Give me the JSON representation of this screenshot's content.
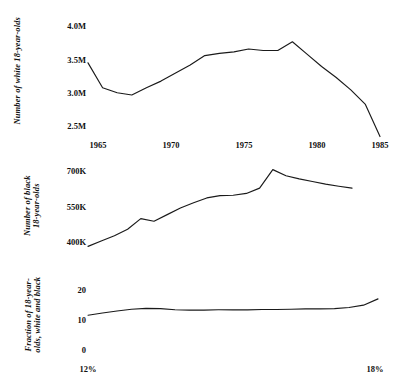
{
  "figure": {
    "background": "#ffffff",
    "line_color": "#1a1a1a",
    "panel_count": 3
  },
  "panels": {
    "white": {
      "axis_title_line1": "Number of white 18-year-olds",
      "axis_title_line2": "",
      "yticks": [
        "2.5M",
        "3.0M",
        "3.5M",
        "4.0M"
      ],
      "xticks": [
        "1965",
        "1970",
        "1975",
        "1980",
        "1985"
      ]
    },
    "black": {
      "axis_title_line1": "Number of black",
      "axis_title_line2": "18-year-olds",
      "yticks": [
        "400K",
        "550K",
        "700K"
      ],
      "xticks": []
    },
    "fraction": {
      "axis_title_line1": "Fraction of 18-year-",
      "axis_title_line2": "olds, white and black",
      "yticks": [
        "0",
        "10",
        "20"
      ],
      "xticks": [
        "12%",
        "18%"
      ]
    }
  },
  "chart_data": [
    {
      "type": "line",
      "title": "",
      "xlabel": "",
      "ylabel": "Number of white 18-year-olds",
      "xlim": [
        1965,
        1985
      ],
      "ylim": [
        2400000,
        4100000
      ],
      "ytick_values": [
        2500000,
        3000000,
        3500000,
        4000000
      ],
      "ytick_labels": [
        "2.5M",
        "3.0M",
        "3.5M",
        "4.0M"
      ],
      "xtick_values": [
        1965,
        1970,
        1975,
        1980,
        1985
      ],
      "xtick_labels": [
        "1965",
        "1970",
        "1975",
        "1980",
        "1985"
      ],
      "grid": false,
      "legend": "none",
      "x": [
        1965,
        1966,
        1967,
        1968,
        1969,
        1970,
        1971,
        1972,
        1973,
        1974,
        1975,
        1976,
        1977,
        1978,
        1979,
        1980,
        1981,
        1982,
        1983,
        1984,
        1985
      ],
      "values": [
        3430000,
        3090000,
        3020000,
        2990000,
        3090000,
        3180000,
        3290000,
        3400000,
        3530000,
        3560000,
        3580000,
        3620000,
        3600000,
        3600000,
        3720000,
        3550000,
        3380000,
        3230000,
        3060000,
        2860000,
        2420000
      ]
    },
    {
      "type": "line",
      "title": "",
      "xlabel": "",
      "ylabel": "Number of black 18-year-olds",
      "xlim": [
        1965,
        1985
      ],
      "ylim": [
        380000,
        720000
      ],
      "ytick_values": [
        400000,
        550000,
        700000
      ],
      "ytick_labels": [
        "400K",
        "550K",
        "700K"
      ],
      "xtick_values": [
        1965,
        1970,
        1975,
        1980,
        1985
      ],
      "xtick_labels": [],
      "grid": false,
      "legend": "none",
      "x": [
        1965,
        1966,
        1967,
        1968,
        1969,
        1970,
        1971,
        1972,
        1973,
        1974,
        1975,
        1976,
        1977,
        1978,
        1979,
        1980,
        1981,
        1982,
        1983,
        1984,
        1985
      ],
      "values": [
        405000,
        425000,
        445000,
        470000,
        510000,
        500000,
        525000,
        550000,
        570000,
        588000,
        597000,
        598000,
        605000,
        625000,
        695000,
        672000,
        660000,
        650000,
        640000,
        632000,
        625000
      ]
    },
    {
      "type": "line",
      "title": "",
      "xlabel": "",
      "ylabel": "Fraction of 18-year-olds, white and black",
      "xlim": [
        1965,
        1985
      ],
      "ylim": [
        -2,
        23
      ],
      "ytick_values": [
        0,
        10,
        20
      ],
      "ytick_labels": [
        "0",
        "10",
        "20"
      ],
      "xtick_values": [
        1965,
        1985
      ],
      "xtick_labels": [
        "12%",
        "18%"
      ],
      "grid": false,
      "legend": "none",
      "x": [
        1965,
        1966,
        1967,
        1968,
        1969,
        1970,
        1971,
        1972,
        1973,
        1974,
        1975,
        1976,
        1977,
        1978,
        1979,
        1980,
        1981,
        1982,
        1983,
        1984,
        1985
      ],
      "values": [
        11.1,
        11.9,
        12.6,
        13.2,
        13.5,
        13.4,
        13.0,
        12.9,
        12.9,
        13.0,
        13.0,
        13.0,
        13.1,
        13.1,
        13.2,
        13.3,
        13.3,
        13.4,
        13.8,
        14.6,
        16.8
      ]
    }
  ]
}
